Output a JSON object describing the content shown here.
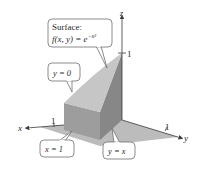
{
  "diagram": {
    "type": "3d-solid-region",
    "axes": {
      "x": {
        "label": "x",
        "tick_label": "1"
      },
      "y": {
        "label": "y",
        "tick_label": "1"
      },
      "z": {
        "label": "z",
        "tick_label": "1"
      }
    },
    "callouts": {
      "surface": {
        "line1": "Surface:",
        "line2_prefix": "f(x, y) = e",
        "line2_exponent": "−x²"
      },
      "plane_y0": {
        "text": "y = 0"
      },
      "plane_x1": {
        "text": "x = 1"
      },
      "plane_yx": {
        "text": "y = x"
      }
    },
    "colors": {
      "top_surface": "#c4c4c4",
      "front_face": "#9d9d9d",
      "right_face": "#858585",
      "base_region": "#aaaaaa",
      "axis": "#3a3a3a",
      "callout_border": "#6e6e6e",
      "callout_fill": "#ffffff"
    }
  }
}
